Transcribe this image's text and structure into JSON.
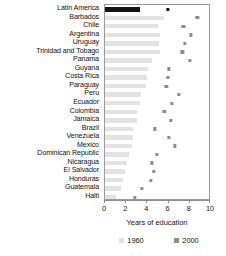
{
  "chart_data": {
    "type": "bar",
    "title": "",
    "xlabel": "Years of education",
    "ylabel": "",
    "xlim": [
      0,
      10
    ],
    "xticks": [
      0,
      2,
      4,
      6,
      8,
      10
    ],
    "grid": false,
    "legend_position": "bottom",
    "orientation": "horizontal",
    "categories": [
      "Latin America",
      "Barbados",
      "Chile",
      "Argentina",
      "Uruguay",
      "Trinidad and Tobago",
      "Panama",
      "Guyana",
      "Costa Rica",
      "Paraguay",
      "Peru",
      "Ecuador",
      "Colombia",
      "Jamaica",
      "Brazil",
      "Venezuela",
      "Mexico",
      "Dominican Republic",
      "Nicaragua",
      "El Salvador",
      "Honduras",
      "Guatemala",
      "Haiti"
    ],
    "series": [
      {
        "name": "1960",
        "color": "#e3e3e3",
        "values": [
          3.3,
          5.6,
          5.0,
          5.2,
          5.1,
          5.2,
          4.4,
          4.1,
          4.0,
          3.9,
          3.4,
          3.3,
          3.0,
          3.0,
          2.6,
          2.6,
          2.5,
          2.3,
          2.1,
          1.9,
          1.7,
          1.5,
          1.0
        ]
      },
      {
        "name": "2000",
        "color": "#8d8d8d",
        "values": [
          5.9,
          8.7,
          7.4,
          8.1,
          7.5,
          7.3,
          8.0,
          6.0,
          5.9,
          5.8,
          7.0,
          6.3,
          5.6,
          6.2,
          4.7,
          6.0,
          6.6,
          4.9,
          4.4,
          4.6,
          4.3,
          3.5,
          2.8
        ]
      }
    ]
  },
  "legend": {
    "items": [
      {
        "label": "1960",
        "color": "#e3e3e3"
      },
      {
        "label": "2000",
        "color": "#8d8d8d"
      }
    ]
  },
  "axis": {
    "x_label": "Years of education",
    "tick_labels": [
      "0",
      "2",
      "4",
      "6",
      "8",
      "10"
    ]
  }
}
